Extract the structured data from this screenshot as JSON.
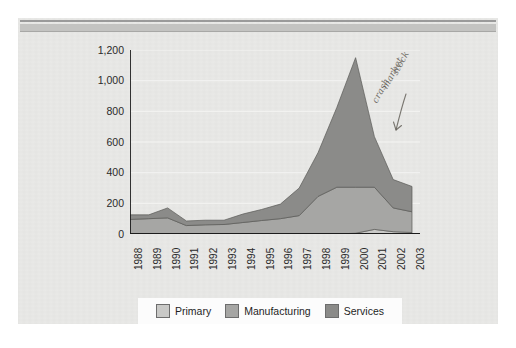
{
  "page": {
    "background_color": "#e9e9e7",
    "rule_color": "#9a9a9a",
    "band_color": "#c3c3c1"
  },
  "annotation": {
    "line1": "stock",
    "line2": "market",
    "line3": "crash",
    "ink_color": "#5e5a52"
  },
  "legend": {
    "position": "bottom",
    "items": [
      {
        "label": "Primary",
        "color": "#c9c9c7"
      },
      {
        "label": "Manufacturing",
        "color": "#a6a6a4"
      },
      {
        "label": "Services",
        "color": "#8b8b89"
      }
    ]
  },
  "chart_data": {
    "type": "area",
    "stacked": true,
    "title": "",
    "subtitle": "",
    "xlabel": "",
    "ylabel": "",
    "grid": true,
    "ylim": [
      0,
      1200
    ],
    "yticks": [
      0,
      200,
      400,
      600,
      800,
      1000,
      1200
    ],
    "ytick_labels": [
      "0",
      "200",
      "400",
      "600",
      "800",
      "1,000",
      "1,200"
    ],
    "categories": [
      "1988",
      "1989",
      "1990",
      "1991",
      "1992",
      "1993",
      "1994",
      "1995",
      "1996",
      "1997",
      "1998",
      "1999",
      "2000",
      "2001",
      "2002",
      "2003"
    ],
    "series": [
      {
        "name": "Primary",
        "color": "#c9c9c7",
        "values": [
          0,
          0,
          0,
          0,
          0,
          0,
          0,
          0,
          0,
          0,
          0,
          0,
          5,
          30,
          15,
          10
        ]
      },
      {
        "name": "Manufacturing",
        "color": "#a6a6a4",
        "values": [
          95,
          100,
          105,
          55,
          60,
          62,
          75,
          88,
          100,
          120,
          245,
          305,
          300,
          275,
          155,
          135
        ]
      },
      {
        "name": "Services",
        "color": "#8b8b89",
        "values": [
          30,
          25,
          65,
          30,
          30,
          28,
          55,
          72,
          95,
          180,
          285,
          520,
          845,
          330,
          185,
          165
        ]
      }
    ],
    "totals": [
      125,
      125,
      170,
      85,
      90,
      90,
      130,
      160,
      195,
      300,
      530,
      825,
      1150,
      635,
      355,
      310
    ],
    "peak": {
      "category": "2000",
      "value": 1150
    }
  }
}
